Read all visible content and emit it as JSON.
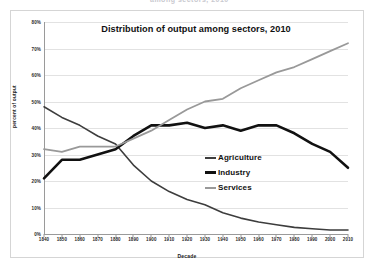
{
  "figure": {
    "clipped_header_text": "among sectors, 2010"
  },
  "chart_data": {
    "type": "line",
    "title": "Distribution of output among sectors, 2010",
    "xlabel": "Decade",
    "ylabel": "percent of output",
    "xlim": [
      1840,
      2010
    ],
    "ylim": [
      0,
      80
    ],
    "grid": true,
    "legend_position": "center-right",
    "x": [
      1840,
      1850,
      1860,
      1870,
      1880,
      1890,
      1900,
      1910,
      1920,
      1930,
      1940,
      1950,
      1960,
      1970,
      1980,
      1990,
      2000,
      2010
    ],
    "y_ticks": [
      "0%",
      "10%",
      "20%",
      "30%",
      "40%",
      "50%",
      "60%",
      "70%",
      "80%"
    ],
    "y_tick_values": [
      0,
      10,
      20,
      30,
      40,
      50,
      60,
      70,
      80
    ],
    "x_ticks": [
      "1840",
      "1850",
      "1860",
      "1870",
      "1880",
      "1890",
      "1900",
      "1910",
      "1920",
      "1930",
      "1940",
      "1950",
      "1960",
      "1970",
      "1980",
      "1990",
      "2000",
      "2010"
    ],
    "series": [
      {
        "name": "Agriculture",
        "color": "#3d3d3d",
        "width": 1.6,
        "values": [
          48,
          44,
          41,
          37,
          34,
          26,
          20,
          16,
          13,
          11,
          8,
          6,
          4.5,
          3.5,
          2.5,
          2,
          1.5,
          1.5
        ]
      },
      {
        "name": "Industry",
        "color": "#111111",
        "width": 2.6,
        "values": [
          21,
          28,
          28,
          30,
          32,
          37,
          41,
          41,
          42,
          40,
          41,
          39,
          41,
          41,
          38,
          34,
          31,
          25
        ]
      },
      {
        "name": "Services",
        "color": "#999999",
        "width": 1.8,
        "values": [
          32,
          31,
          33,
          33,
          33,
          36,
          39,
          43,
          47,
          50,
          51,
          55,
          58,
          61,
          63,
          66,
          69,
          72
        ]
      }
    ]
  },
  "legend": {
    "items": [
      {
        "label": "Agriculture",
        "color": "#3d3d3d",
        "thickness": 2
      },
      {
        "label": "Industry",
        "color": "#111111",
        "thickness": 3
      },
      {
        "label": "Services",
        "color": "#999999",
        "thickness": 2
      }
    ]
  }
}
